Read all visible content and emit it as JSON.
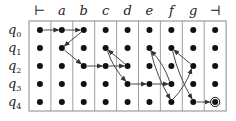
{
  "diagram": {
    "type": "two-way-automaton-run-grid",
    "columns": [
      "⊢",
      "a",
      "b",
      "c",
      "d",
      "e",
      "f",
      "g",
      "⊣"
    ],
    "rows": [
      {
        "state": "q",
        "sub": "0"
      },
      {
        "state": "q",
        "sub": "1"
      },
      {
        "state": "q",
        "sub": "2"
      },
      {
        "state": "q",
        "sub": "3"
      },
      {
        "state": "q",
        "sub": "4"
      }
    ],
    "colors": {
      "line": "#888888",
      "dot": "#111111",
      "arrow": "#333333",
      "text": "#222222"
    },
    "edges": [
      {
        "from": [
          0,
          0
        ],
        "to": [
          0,
          1
        ]
      },
      {
        "from": [
          0,
          1
        ],
        "to": [
          0,
          2
        ]
      },
      {
        "from": [
          0,
          2
        ],
        "to": [
          1,
          1
        ]
      },
      {
        "from": [
          1,
          1
        ],
        "to": [
          2,
          2
        ]
      },
      {
        "from": [
          2,
          2
        ],
        "to": [
          2,
          3
        ]
      },
      {
        "from": [
          2,
          3
        ],
        "to": [
          2,
          4
        ]
      },
      {
        "from": [
          2,
          4
        ],
        "to": [
          1,
          3
        ]
      },
      {
        "from": [
          1,
          3
        ],
        "to": [
          3,
          4
        ]
      },
      {
        "from": [
          3,
          4
        ],
        "to": [
          3,
          5
        ]
      },
      {
        "from": [
          3,
          5
        ],
        "to": [
          3,
          6
        ]
      },
      {
        "from": [
          3,
          6
        ],
        "to": [
          1,
          5
        ]
      },
      {
        "from": [
          1,
          5
        ],
        "to": [
          4,
          6
        ]
      },
      {
        "from": [
          4,
          6
        ],
        "to": [
          2,
          7
        ]
      },
      {
        "from": [
          2,
          7
        ],
        "to": [
          1,
          6
        ]
      },
      {
        "from": [
          1,
          6
        ],
        "to": [
          4,
          7
        ]
      },
      {
        "from": [
          4,
          7
        ],
        "to": [
          4,
          8
        ]
      }
    ],
    "accepting": [
      4,
      8
    ]
  }
}
